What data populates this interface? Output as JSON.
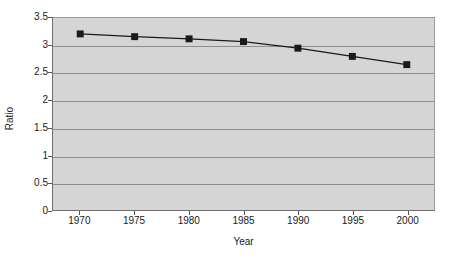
{
  "chart_data": {
    "type": "line",
    "title": "",
    "subtitle": "",
    "xlabel": "Year",
    "ylabel": "Ratio",
    "x": [
      1970,
      1975,
      1980,
      1985,
      1990,
      1995,
      2000
    ],
    "categories": [
      "1970",
      "1975",
      "1980",
      "1985",
      "1990",
      "1995",
      "2000"
    ],
    "values": [
      3.21,
      3.16,
      3.12,
      3.07,
      2.95,
      2.8,
      2.65
    ],
    "series": [
      {
        "name": "Ratio",
        "values": [
          3.21,
          3.16,
          3.12,
          3.07,
          2.95,
          2.8,
          2.65
        ]
      }
    ],
    "xlim": [
      1967.5,
      2002.5
    ],
    "ylim": [
      0,
      3.5
    ],
    "ytick_labels": [
      "0",
      "0.5",
      "1",
      "1.5",
      "2",
      "2.5",
      "3",
      "3.5"
    ],
    "ytick_values": [
      0,
      0.5,
      1,
      1.5,
      2,
      2.5,
      3,
      3.5
    ],
    "xtick_labels": [
      "1970",
      "1975",
      "1980",
      "1985",
      "1990",
      "1995",
      "2000"
    ],
    "grid": "horizontal",
    "legend": "none",
    "marker": "square",
    "annotations": []
  },
  "style": {
    "plot_background": "#d5d5d5",
    "page_background": "#ffffff",
    "gridline_color": "#8e8e8e",
    "axis_color": "#6e6e6e",
    "series_color": "#1a1a1a",
    "marker_color": "#1a1a1a",
    "text_color": "#1a1a1a"
  }
}
